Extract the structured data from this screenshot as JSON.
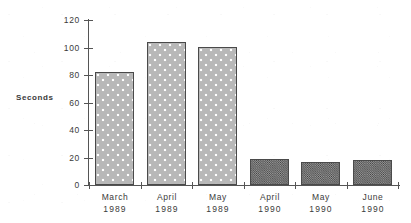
{
  "chart_data": {
    "type": "bar",
    "title": "",
    "xlabel": "",
    "ylabel": "Seconds",
    "categories": [
      "March 1989",
      "April 1989",
      "May 1989",
      "April 1990",
      "May 1990",
      "June 1990"
    ],
    "category_lines": [
      {
        "month": "March",
        "year": "1989"
      },
      {
        "month": "April",
        "year": "1989"
      },
      {
        "month": "May",
        "year": "1989"
      },
      {
        "month": "April",
        "year": "1990"
      },
      {
        "month": "May",
        "year": "1990"
      },
      {
        "month": "June",
        "year": "1990"
      }
    ],
    "values": [
      82,
      104,
      100,
      19,
      17,
      18
    ],
    "ylim": [
      0,
      120
    ],
    "ytick_labels": [
      "0",
      "20",
      "40",
      "60",
      "80",
      "100",
      "120"
    ],
    "ytick_values": [
      0,
      20,
      40,
      60,
      80,
      100,
      120
    ],
    "grid": false,
    "legend": false,
    "legend_position": "none",
    "series": [
      {
        "name": "Seconds",
        "values": [
          82,
          104,
          100,
          19,
          17,
          18
        ],
        "fills": [
          "light",
          "light",
          "light",
          "dark",
          "dark",
          "dark"
        ]
      }
    ],
    "colors": {
      "bar_light_fill": "#b8b8b8",
      "bar_light_dot": "#ffffff",
      "bar_dark_fill": "#6e6e6e",
      "bar_outline": "#4a4a4a",
      "axis": "#555555",
      "text": "#3a3a3a",
      "background": "#ffffff"
    }
  },
  "axis": {
    "y_title": "Seconds"
  }
}
